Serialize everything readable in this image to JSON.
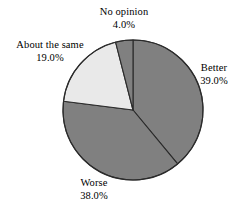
{
  "chart_data": {
    "type": "pie",
    "title": "",
    "subtitle": "",
    "xlabel": "",
    "ylabel": "",
    "legend": "none",
    "grid": false,
    "value_unit": "%",
    "start_angle_deg": 0,
    "direction": "clockwise",
    "center": {
      "cx": 133,
      "cy": 110,
      "r": 70
    },
    "categories": [
      "Better",
      "Worse",
      "About the same",
      "No opinion"
    ],
    "values": [
      39.0,
      38.0,
      19.0,
      4.0
    ],
    "slices": [
      {
        "label": "Better",
        "value": 39.0,
        "value_text": "39.0%",
        "color": "#808080",
        "start_deg": 0.0,
        "end_deg": 140.4,
        "label_pos": "right"
      },
      {
        "label": "Worse",
        "value": 38.0,
        "value_text": "38.0%",
        "color": "#808080",
        "start_deg": 140.4,
        "end_deg": 277.2,
        "label_pos": "bottom"
      },
      {
        "label": "About the same",
        "value": 19.0,
        "value_text": "19.0%",
        "color": "#e9e9e9",
        "start_deg": 277.2,
        "end_deg": 345.6,
        "label_pos": "left"
      },
      {
        "label": "No opinion",
        "value": 4.0,
        "value_text": "4.0%",
        "color": "#808080",
        "start_deg": 345.6,
        "end_deg": 360.0,
        "label_pos": "top"
      }
    ],
    "colors": {
      "slice_gray": "#808080",
      "slice_light": "#e9e9e9",
      "outline": "#2b2b2b",
      "background": "#ffffff",
      "text": "#000000"
    }
  },
  "labels": {
    "better": {
      "name": "Better",
      "value": "39.0%"
    },
    "worse": {
      "name": "Worse",
      "value": "38.0%"
    },
    "about_same": {
      "name": "About the same",
      "value": "19.0%"
    },
    "no_opinion": {
      "name": "No opinion",
      "value": "4.0%"
    }
  }
}
